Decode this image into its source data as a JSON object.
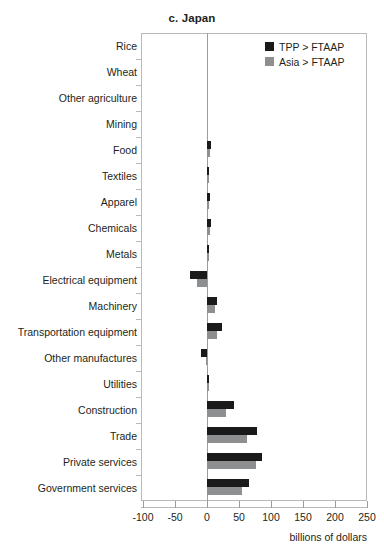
{
  "chart_data": {
    "type": "bar",
    "orientation": "horizontal",
    "title": "c. Japan",
    "xlabel": "billions of dollars",
    "ylabel": "",
    "xlim": [
      -100,
      250
    ],
    "xticks": [
      -100,
      -50,
      0,
      50,
      100,
      150,
      200,
      250
    ],
    "xtick_labels": [
      "-100",
      "-50",
      "0",
      "50",
      "100",
      "150",
      "200",
      "250"
    ],
    "grid": false,
    "legend_position": "top-right",
    "categories": [
      "Rice",
      "Wheat",
      "Other agriculture",
      "Mining",
      "Food",
      "Textiles",
      "Apparel",
      "Chemicals",
      "Metals",
      "Electrical equipment",
      "Machinery",
      "Transportation equipment",
      "Other manufactures",
      "Utilities",
      "Construction",
      "Trade",
      "Private services",
      "Government services"
    ],
    "series": [
      {
        "name": "TPP > FTAAP",
        "color": "#1a1a1a",
        "values": [
          0,
          0,
          0,
          0,
          7,
          2,
          4,
          6,
          3,
          -27,
          16,
          23,
          -9,
          1,
          42,
          78,
          86,
          65
        ]
      },
      {
        "name": "Asia > FTAAP",
        "color": "#8d8f91",
        "values": [
          0,
          0,
          0,
          0,
          5,
          1,
          2,
          4,
          2,
          -16,
          12,
          15,
          -2,
          1,
          30,
          63,
          77,
          55
        ]
      }
    ]
  },
  "legend": {
    "items": [
      {
        "label": "TPP > FTAAP",
        "color": "#1a1a1a"
      },
      {
        "label": "Asia > FTAAP",
        "color": "#8d8f91"
      }
    ]
  }
}
